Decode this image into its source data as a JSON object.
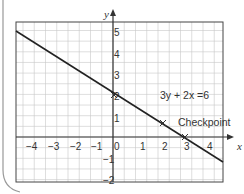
{
  "chart_data": {
    "type": "line",
    "title": "",
    "xlabel": "x",
    "ylabel": "y",
    "xlim": [
      -4.5,
      4.5
    ],
    "ylim": [
      -2,
      5.5
    ],
    "x_ticks": [
      "-4",
      "-3",
      "-2",
      "-1",
      "0",
      "1",
      "2",
      "3",
      "4"
    ],
    "y_ticks": [
      "-2",
      "-1",
      "1",
      "2",
      "3",
      "4",
      "5"
    ],
    "grid": true,
    "grid_step": 0.5,
    "series": [
      {
        "name": "3y + 2x =6",
        "equation": "3y + 2x =6",
        "x": [
          -4.5,
          4.5
        ],
        "y": [
          5.0,
          -1.0
        ],
        "color": "#222222"
      }
    ],
    "marked_points": [
      {
        "x": 0,
        "y": 2,
        "marker": "x"
      },
      {
        "x": 2,
        "y": 0.67,
        "marker": "x",
        "label": "Checkpoint"
      },
      {
        "x": 3,
        "y": 0,
        "marker": "x"
      }
    ],
    "annotations": [
      {
        "text": "3y + 2x =6",
        "x": 2.3,
        "y": 1.5
      },
      {
        "text": "Checkpoint",
        "x": 2.5,
        "y": 0.7
      }
    ]
  },
  "labels": {
    "equation": "3y + 2x =6",
    "checkpoint": "Checkpoint",
    "x_axis": "x",
    "y_axis": "y",
    "x_ticks": [
      "−4",
      "−3",
      "−2",
      "−1",
      "0",
      "1",
      "2",
      "3",
      "4"
    ],
    "y_ticks_pos": [
      "5",
      "4",
      "3",
      "2",
      "1"
    ],
    "y_ticks_neg": [
      "−1",
      "−2"
    ]
  }
}
